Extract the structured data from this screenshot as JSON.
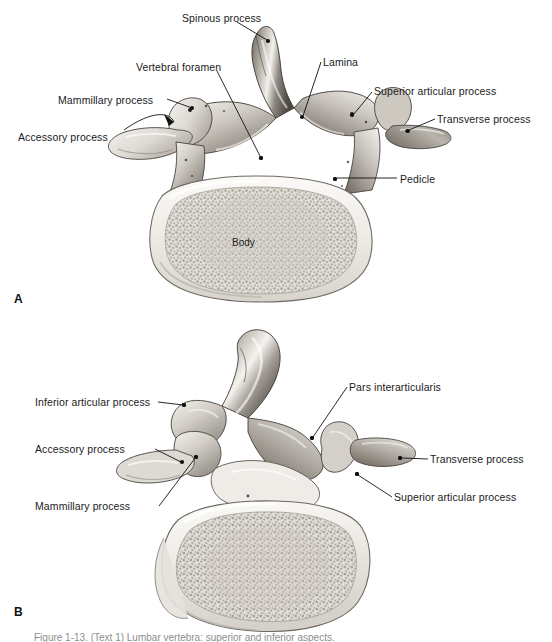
{
  "figure": {
    "background_color": "#ffffff",
    "text_color": "#1b1b1b",
    "leader_color": "#111111",
    "panel_a_letter": "A",
    "panel_b_letter": "B",
    "caption": "Figure 1-13.  (Text 1)  Lumbar vertebra: superior and inferior  aspects."
  },
  "panel_a": {
    "name": "superior-view-lumbar-vertebra",
    "inner_labels": [
      {
        "id": "body",
        "text": "Body",
        "x": 232,
        "y": 237
      }
    ],
    "annotations": [
      {
        "id": "spinous-process",
        "text": "Spinous process",
        "x": 182,
        "y": 12,
        "align": "left",
        "tx": 268,
        "ty": 41
      },
      {
        "id": "lamina",
        "text": "Lamina",
        "x": 323,
        "y": 56,
        "align": "left",
        "tx": 302,
        "ty": 117
      },
      {
        "id": "vertebral-foramen",
        "text": "Vertebral  foramen",
        "x": 136,
        "y": 61,
        "align": "left",
        "tx": 261,
        "ty": 158
      },
      {
        "id": "superior-articular-process",
        "text": "Superior articular process",
        "x": 374,
        "y": 85,
        "align": "left",
        "tx": 352,
        "ty": 115
      },
      {
        "id": "mammillary-process",
        "text": "Mammillary process",
        "x": 58,
        "y": 94,
        "align": "left",
        "tx": 194,
        "ty": 109
      },
      {
        "id": "transverse-process",
        "text": "Transverse process",
        "x": 437,
        "y": 113,
        "align": "left",
        "tx": 407,
        "ty": 131
      },
      {
        "id": "accessory-process",
        "text": "Accessory process",
        "x": 18,
        "y": 131,
        "align": "left",
        "tx": 172,
        "ty": 121
      },
      {
        "id": "pedicle",
        "text": "Pedicle",
        "x": 400,
        "y": 173,
        "align": "left",
        "tx": 335,
        "ty": 179
      }
    ]
  },
  "panel_b": {
    "name": "inferior-view-lumbar-vertebra",
    "annotations": [
      {
        "id": "pars-interarticularis",
        "text": "Pars interarticularis",
        "x": 349,
        "y": 381,
        "align": "left",
        "tx": 312,
        "ty": 438
      },
      {
        "id": "inferior-articular-process",
        "text": "Inferior articular process",
        "x": 35,
        "y": 396,
        "align": "left",
        "tx": 184,
        "ty": 405
      },
      {
        "id": "accessory-process-b",
        "text": "Accessory process",
        "x": 35,
        "y": 443,
        "align": "left",
        "tx": 182,
        "ty": 462
      },
      {
        "id": "transverse-process-b",
        "text": "Transverse process",
        "x": 430,
        "y": 455,
        "align": "left",
        "tx": 400,
        "ty": 458
      },
      {
        "id": "mammillary-process-b",
        "text": "Mammillary process",
        "x": 35,
        "y": 503,
        "align": "left",
        "tx": 195,
        "ty": 457
      },
      {
        "id": "superior-articular-process-b",
        "text": "Superior articular process",
        "x": 394,
        "y": 493,
        "align": "left",
        "tx": 357,
        "ty": 474
      }
    ]
  }
}
